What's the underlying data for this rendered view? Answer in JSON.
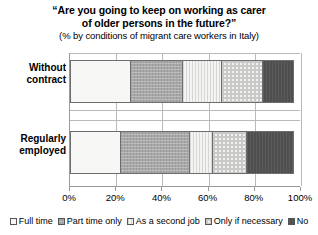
{
  "chart_data": {
    "type": "bar",
    "orientation": "horizontal",
    "stacked": true,
    "normalized_percent": true,
    "title": "“Are you going to keep on working as carer",
    "title_line2": "of older persons in the future?”",
    "subtitle": "(% by conditions of migrant care workers in Italy)",
    "xlabel": "",
    "ylabel": "",
    "xlim": [
      0,
      100
    ],
    "xticks": [
      0,
      20,
      40,
      60,
      80,
      100
    ],
    "xtick_labels": [
      "0%",
      "20%",
      "40%",
      "60%",
      "80%",
      "100%"
    ],
    "grid": true,
    "legend_position": "bottom",
    "categories": [
      "Without contract",
      "Regularly employed"
    ],
    "series": [
      {
        "name": "Full time",
        "values": [
          26,
          22
        ],
        "color": "#f7f7f5",
        "pattern": "solid-light"
      },
      {
        "name": "Part time only",
        "values": [
          23,
          30
        ],
        "color": "#a8a8a8",
        "pattern": "dense-grey"
      },
      {
        "name": "As a second job",
        "values": [
          17,
          10
        ],
        "color": "#ebebe9",
        "pattern": "vertical-stripes"
      },
      {
        "name": "Only if necessary",
        "values": [
          18,
          15
        ],
        "color": "#f2f2f0",
        "pattern": "checker-dots"
      },
      {
        "name": "No",
        "values": [
          13,
          20
        ],
        "color": "#4f4f4f",
        "pattern": "solid-dark"
      }
    ]
  }
}
